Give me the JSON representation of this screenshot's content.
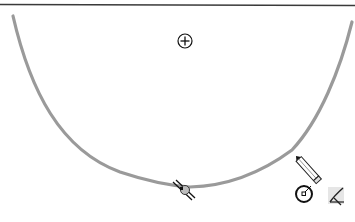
{
  "canvas": {
    "type": "sketch-canvas",
    "background": "#ffffff",
    "top_border_color": "#3a3a3a",
    "arc": {
      "type": "arc",
      "stroke_color": "#9a9a9a",
      "center_marker": "origin-point-icon",
      "midpoint_marker": "coincident-relation-icon"
    },
    "cursor": {
      "icon": "pencil-icon",
      "feedback_icons": [
        "centerpoint-arc-icon",
        "tangent-arc-icon"
      ]
    }
  }
}
